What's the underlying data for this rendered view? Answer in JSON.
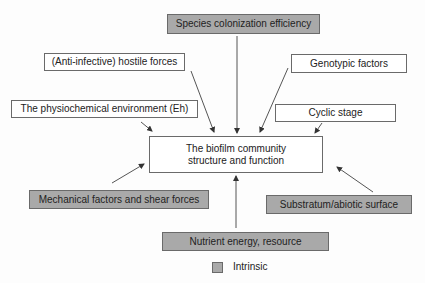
{
  "diagram": {
    "center": {
      "line1": "The biofilm community",
      "line2": "structure and function"
    },
    "factors": {
      "species": "Species colonization efficiency",
      "hostile": "(Anti-infective) hostile forces",
      "genotypic": "Genotypic factors",
      "physiochemical": "The physiochemical environment (Eh)",
      "cyclic": "Cyclic stage",
      "mechanical": "Mechanical factors and shear forces",
      "substratum": "Substratum/abiotic surface",
      "nutrient": "Nutrient energy, resource"
    },
    "legend": {
      "label": "Intrinsic",
      "color": "#a9a9a9"
    }
  }
}
